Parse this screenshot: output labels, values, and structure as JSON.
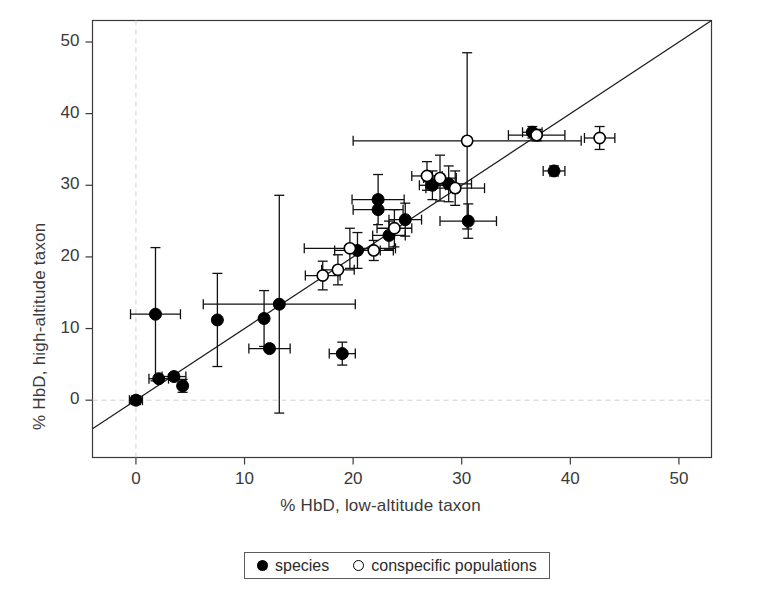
{
  "chart_data": {
    "type": "scatter",
    "title": "",
    "xlabel": "% HbD, low-altitude taxon",
    "ylabel": "% HbD, high-altitude taxon",
    "xlim": [
      -4,
      53
    ],
    "ylim": [
      -8,
      53
    ],
    "xticks": [
      0,
      10,
      20,
      30,
      40,
      50
    ],
    "yticks": [
      0,
      10,
      20,
      30,
      40,
      50
    ],
    "xtick_labels": [
      "0",
      "10",
      "20",
      "30",
      "40",
      "50"
    ],
    "ytick_labels": [
      "0",
      "10",
      "20",
      "30",
      "40",
      "50"
    ],
    "grid": false,
    "reference_lines": [
      {
        "name": "identity-line",
        "type": "diagonal",
        "slope": 1,
        "intercept": 0,
        "style": "solid"
      },
      {
        "name": "zero-x-line",
        "type": "vertical",
        "value": 0,
        "style": "dashed"
      },
      {
        "name": "zero-y-line",
        "type": "horizontal",
        "value": 0,
        "style": "dashed"
      }
    ],
    "legend": {
      "position": "below-plot",
      "entries": [
        {
          "symbol": "filled-circle",
          "label": "species"
        },
        {
          "symbol": "open-circle",
          "label": "conspecific populations"
        }
      ]
    },
    "series": [
      {
        "name": "species",
        "symbol": "filled-circle",
        "points": [
          {
            "x": 0.0,
            "y": 0.0,
            "xerr": 0.6,
            "yerr": 0.6
          },
          {
            "x": 2.1,
            "y": 3.0,
            "xerr": 0.9,
            "yerr": 0.0
          },
          {
            "x": 3.5,
            "y": 3.3,
            "xerr": 1.1,
            "yerr": 0.0
          },
          {
            "x": 4.3,
            "y": 2.0,
            "xerr": 0.0,
            "yerr": 0.9
          },
          {
            "x": 1.8,
            "y": 12.0,
            "xerr": 2.3,
            "yerr": 9.3
          },
          {
            "x": 7.5,
            "y": 11.2,
            "xerr": 0.0,
            "yerr": 6.5
          },
          {
            "x": 11.8,
            "y": 11.4,
            "xerr": 0.0,
            "yerr": 3.9
          },
          {
            "x": 13.2,
            "y": 13.4,
            "xerr": 7.0,
            "yerr": 15.2
          },
          {
            "x": 12.3,
            "y": 7.2,
            "xerr": 1.9,
            "yerr": 0.0
          },
          {
            "x": 19.0,
            "y": 6.5,
            "xerr": 1.2,
            "yerr": 1.6
          },
          {
            "x": 22.3,
            "y": 28.0,
            "xerr": 2.4,
            "yerr": 3.5
          },
          {
            "x": 22.3,
            "y": 26.6,
            "xerr": 2.3,
            "yerr": 0.0
          },
          {
            "x": 20.4,
            "y": 20.9,
            "xerr": 2.1,
            "yerr": 2.5
          },
          {
            "x": 23.3,
            "y": 23.0,
            "xerr": 1.5,
            "yerr": 2.0
          },
          {
            "x": 24.8,
            "y": 25.2,
            "xerr": 1.5,
            "yerr": 2.3
          },
          {
            "x": 27.3,
            "y": 30.0,
            "xerr": 1.2,
            "yerr": 2.0
          },
          {
            "x": 28.8,
            "y": 30.2,
            "xerr": 2.1,
            "yerr": 2.5
          },
          {
            "x": 30.6,
            "y": 25.0,
            "xerr": 2.6,
            "yerr": 2.4
          },
          {
            "x": 36.5,
            "y": 37.4,
            "xerr": 0.9,
            "yerr": 0.8
          },
          {
            "x": 38.5,
            "y": 32.0,
            "xerr": 1.0,
            "yerr": 0.7
          }
        ]
      },
      {
        "name": "conspecific populations",
        "symbol": "open-circle",
        "points": [
          {
            "x": 17.2,
            "y": 17.4,
            "xerr": 1.6,
            "yerr": 2.0
          },
          {
            "x": 18.6,
            "y": 18.2,
            "xerr": 1.5,
            "yerr": 2.1
          },
          {
            "x": 19.7,
            "y": 21.2,
            "xerr": 4.2,
            "yerr": 2.8
          },
          {
            "x": 21.9,
            "y": 20.9,
            "xerr": 1.8,
            "yerr": 1.4
          },
          {
            "x": 23.8,
            "y": 24.0,
            "xerr": 1.6,
            "yerr": 2.6
          },
          {
            "x": 26.8,
            "y": 31.3,
            "xerr": 1.4,
            "yerr": 2.0
          },
          {
            "x": 28.0,
            "y": 31.0,
            "xerr": 1.5,
            "yerr": 3.2
          },
          {
            "x": 29.4,
            "y": 29.6,
            "xerr": 2.7,
            "yerr": 2.4
          },
          {
            "x": 30.5,
            "y": 36.2,
            "xerr": 10.5,
            "yerr": 12.3
          },
          {
            "x": 36.9,
            "y": 37.0,
            "xerr": 2.6,
            "yerr": 0.8
          },
          {
            "x": 42.7,
            "y": 36.6,
            "xerr": 1.4,
            "yerr": 1.6
          }
        ]
      }
    ]
  }
}
